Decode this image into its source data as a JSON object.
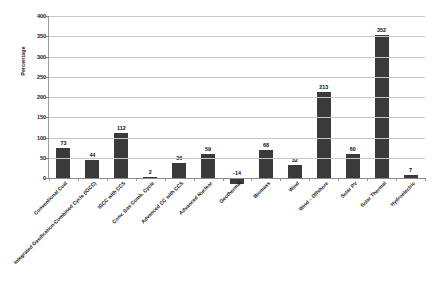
{
  "chart_data": {
    "type": "bar",
    "title": "",
    "xlabel": "",
    "ylabel": "Percentage",
    "ylim": [
      -50,
      400
    ],
    "yticks": [
      400,
      350,
      300,
      250,
      200,
      150,
      100,
      50,
      0
    ],
    "grid": true,
    "legend": "none",
    "bar_color": "#3a3a3a",
    "categories": [
      "Conventional Coal",
      "Integrated Gasification-Combined Cycle (IGCC)",
      "IGCC with CCS",
      "Conv. Gas Comb. Cycle",
      "Advanced CC with CCS",
      "Advanced Nuclear",
      "Geothermal",
      "Biomass",
      "Wind",
      "Wind – Offshore",
      "Solar PV",
      "Solar Thermal",
      "Hydroelectric"
    ],
    "values": [
      73,
      44,
      112,
      2,
      36,
      59,
      -14,
      68,
      32,
      213,
      60,
      352,
      7
    ],
    "value_labels": [
      "73",
      "44",
      "112",
      "2",
      "36",
      "59",
      "-14",
      "68",
      "32",
      "213",
      "60",
      "352",
      "7"
    ]
  }
}
